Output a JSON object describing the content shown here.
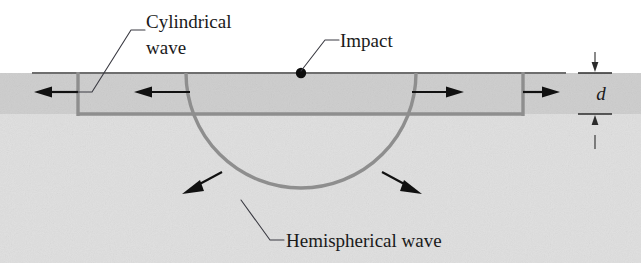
{
  "figure": {
    "background_color": "#ffffff",
    "width": 641,
    "height": 264
  },
  "labels": {
    "cylindrical_wave_line1": "Cylindrical",
    "cylindrical_wave_line2": "wave",
    "impact": "Impact",
    "hemispherical_wave": "Hemispherical wave",
    "thickness_symbol": "d"
  },
  "colors": {
    "wavefront": "#8e8e8e",
    "surface": "#6e6e6e",
    "arrow": "#111111",
    "leader": "#3a3a42",
    "text": "#1a1a1a",
    "plate_fill": "#d4d4d4",
    "substrate_fill": "#e3e3e3"
  },
  "geometry": {
    "surface_y": 73,
    "plate_bottom_y": 114,
    "plate_thickness_px": 41,
    "impact_x": 301,
    "impact_y": 73,
    "hemisphere_radius_px": 115,
    "cylindrical_front_left_x": 78,
    "cylindrical_front_right_x": 523
  },
  "icons": {
    "impact_point": "impact-dot",
    "arrow_left": "arrow-left-icon",
    "arrow_right": "arrow-right-icon",
    "arrow_diagonal": "arrow-diagonal-icon",
    "dimension_arrow": "dimension-arrow-icon"
  }
}
